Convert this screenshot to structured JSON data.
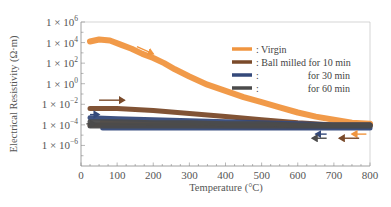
{
  "chart_data": {
    "type": "line",
    "title": "",
    "xlabel": "Temperature (°C)",
    "ylabel": "Electrical Resistivity (Ω·m)",
    "xlim": [
      0,
      800
    ],
    "ylim_log10": [
      -7,
      6
    ],
    "yscale": "log",
    "grid": false,
    "legend_position": "top-right",
    "x_ticks": [
      0,
      100,
      200,
      300,
      400,
      500,
      600,
      700,
      800
    ],
    "y_ticks": [
      {
        "exp": 6,
        "label_base": "1 × 10",
        "label_exp": "6"
      },
      {
        "exp": 4,
        "label_base": "1 × 10",
        "label_exp": "4"
      },
      {
        "exp": 2,
        "label_base": "1 × 10",
        "label_exp": "2"
      },
      {
        "exp": 0,
        "label_base": "1 × 10",
        "label_exp": "0"
      },
      {
        "exp": -2,
        "label_base": "1 × 10",
        "label_exp": "−2"
      },
      {
        "exp": -4,
        "label_base": "1 × 10",
        "label_exp": "−4"
      },
      {
        "exp": -6,
        "label_base": "1 × 10",
        "label_exp": "−6"
      }
    ],
    "series": [
      {
        "name": "Virgin",
        "legend_label": ": Virgin",
        "color": "#F0953F",
        "heating": {
          "x": [
            25,
            50,
            80,
            110,
            140,
            170,
            200,
            230,
            260,
            300,
            350,
            400,
            450,
            500,
            550,
            600,
            650,
            700,
            750,
            800
          ],
          "log10_y": [
            4.1,
            4.3,
            4.2,
            3.8,
            3.4,
            2.9,
            2.5,
            2.0,
            1.4,
            0.7,
            -0.1,
            -0.7,
            -1.3,
            -1.8,
            -2.3,
            -2.8,
            -3.2,
            -3.5,
            -3.8,
            -3.9
          ]
        },
        "cooling": {
          "x": [
            800,
            700,
            600,
            500,
            400,
            300,
            200,
            100,
            60
          ],
          "log10_y": [
            -4.0,
            -4.1,
            -4.2,
            -4.2,
            -4.1,
            -4.0,
            -3.9,
            -3.8,
            -3.8
          ]
        }
      },
      {
        "name": "Ball milled for 10 min",
        "legend_label": ": Ball milled for 10 min",
        "color": "#7A4A2A",
        "heating": {
          "x": [
            25,
            100,
            200,
            300,
            400,
            500,
            600,
            700,
            800
          ],
          "log10_y": [
            -2.4,
            -2.4,
            -2.6,
            -2.9,
            -3.2,
            -3.5,
            -3.8,
            -4.0,
            -4.0
          ]
        },
        "cooling": {
          "x": [
            800,
            600,
            400,
            200,
            25
          ],
          "log10_y": [
            -4.1,
            -4.1,
            -4.0,
            -4.0,
            -4.0
          ]
        }
      },
      {
        "name": "Ball milled for 30 min",
        "legend_label": ":",
        "legend_suffix": "for 30 min",
        "color": "#34497A",
        "heating": {
          "x": [
            25,
            100,
            200,
            300,
            400,
            500,
            600,
            700,
            800
          ],
          "log10_y": [
            -3.3,
            -3.4,
            -3.5,
            -3.6,
            -3.7,
            -3.8,
            -3.9,
            -4.0,
            -4.0
          ]
        },
        "cooling": {
          "x": [
            800,
            600,
            400,
            200,
            60
          ],
          "log10_y": [
            -4.3,
            -4.3,
            -4.3,
            -4.3,
            -4.3
          ]
        }
      },
      {
        "name": "Ball milled for 60 min",
        "legend_label": ":",
        "legend_suffix": "for 60 min",
        "color": "#4B4B4B",
        "heating": {
          "x": [
            25,
            100,
            200,
            300,
            400,
            500,
            600,
            700,
            800
          ],
          "log10_y": [
            -3.7,
            -3.7,
            -3.8,
            -3.8,
            -3.9,
            -3.9,
            -4.0,
            -4.0,
            -4.0
          ]
        },
        "cooling": {
          "x": [
            800,
            600,
            400,
            200,
            25
          ],
          "log10_y": [
            -4.1,
            -4.1,
            -4.1,
            -4.1,
            -4.1
          ]
        }
      }
    ],
    "annotations": [
      {
        "type": "arrow",
        "direction": "right",
        "series": "Virgin",
        "x": [
          155,
          200
        ],
        "log10_y": [
          3.6,
          2.9
        ]
      },
      {
        "type": "arrow",
        "direction": "right",
        "series": "Ball milled for 10 min",
        "x": [
          50,
          120
        ],
        "log10_y": [
          -1.6,
          -1.6
        ]
      },
      {
        "type": "arrow",
        "direction": "right",
        "series": "Ball milled for 30 min",
        "x": [
          25,
          50
        ],
        "log10_y": [
          -3.0,
          -3.0
        ]
      },
      {
        "type": "arrow",
        "direction": "right",
        "series": "Ball milled for 60 min",
        "x": [
          15,
          40
        ],
        "log10_y": [
          -3.9,
          -3.9
        ]
      },
      {
        "type": "arrow",
        "direction": "left",
        "series": "Virgin",
        "x": [
          790,
          750
        ],
        "log10_y": [
          -4.9,
          -4.9
        ]
      },
      {
        "type": "arrow",
        "direction": "left",
        "series": "Ball milled for 10 min",
        "x": [
          770,
          715
        ],
        "log10_y": [
          -5.3,
          -5.3
        ]
      },
      {
        "type": "arrow",
        "direction": "left",
        "series": "Ball milled for 30 min",
        "x": [
          680,
          650
        ],
        "log10_y": [
          -4.9,
          -4.9
        ]
      },
      {
        "type": "arrow",
        "direction": "left",
        "series": "Ball milled for 60 min",
        "x": [
          680,
          640
        ],
        "log10_y": [
          -5.3,
          -5.3
        ]
      }
    ]
  }
}
